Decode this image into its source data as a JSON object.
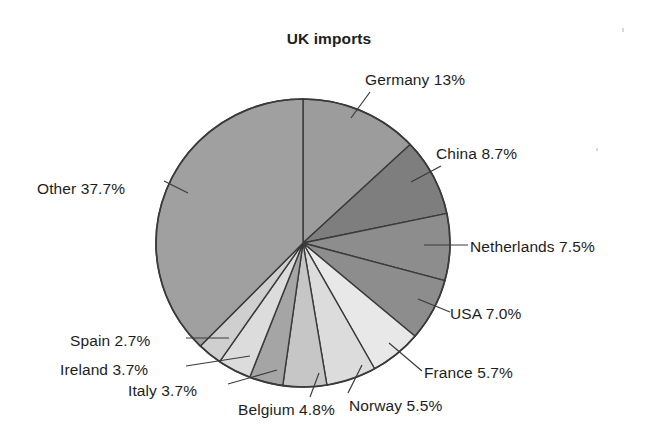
{
  "chart_data": {
    "type": "pie",
    "title": "UK imports",
    "xlabel": "",
    "ylabel": "",
    "legend_position": "none",
    "grid": false,
    "start_angle_deg": 0,
    "direction": "clockwise",
    "categories": [
      "Germany",
      "China",
      "Netherlands",
      "USA",
      "France",
      "Norway",
      "Belgium",
      "Italy",
      "Ireland",
      "Spain",
      "Other"
    ],
    "values": [
      13.0,
      8.7,
      7.5,
      7.0,
      5.7,
      5.5,
      4.8,
      3.7,
      3.7,
      2.7,
      37.7
    ],
    "slices": [
      {
        "label": "Germany 13%",
        "name": "Germany",
        "value": 13.0,
        "color": "#9c9c9c",
        "label_x": 365,
        "label_y": 71,
        "anchor": "start",
        "leader": [
          [
            351,
            118
          ],
          [
            370,
            92
          ]
        ]
      },
      {
        "label": "China 8.7%",
        "name": "China",
        "value": 8.7,
        "color": "#7e7e7e",
        "label_x": 436,
        "label_y": 145,
        "anchor": "start",
        "leader": [
          [
            411,
            182
          ],
          [
            441,
            166
          ]
        ]
      },
      {
        "label": "Netherlands 7.5%",
        "name": "Netherlands",
        "value": 7.5,
        "color": "#8d8d8d",
        "label_x": 470,
        "label_y": 238,
        "anchor": "start",
        "leader": [
          [
            424,
            245
          ],
          [
            468,
            245
          ]
        ]
      },
      {
        "label": "USA 7.0%",
        "name": "USA",
        "value": 7.0,
        "color": "#8d8d8d",
        "label_x": 450,
        "label_y": 305,
        "anchor": "start",
        "leader": [
          [
            418,
            299
          ],
          [
            450,
            312
          ]
        ]
      },
      {
        "label": "France 5.7%",
        "name": "France",
        "value": 5.7,
        "color": "#e8e8e8",
        "label_x": 424,
        "label_y": 364,
        "anchor": "start",
        "leader": [
          [
            389,
            343
          ],
          [
            422,
            371
          ]
        ]
      },
      {
        "label": "Norway 5.5%",
        "name": "Norway",
        "value": 5.5,
        "color": "#dcdcdc",
        "label_x": 349,
        "label_y": 397,
        "anchor": "start",
        "leader": [
          [
            362,
            365
          ],
          [
            348,
            393
          ]
        ]
      },
      {
        "label": "Belgium 4.8%",
        "name": "Belgium",
        "value": 4.8,
        "color": "#c6c6c6",
        "label_x": 238,
        "label_y": 401,
        "anchor": "start",
        "leader": [
          [
            319,
            373
          ],
          [
            310,
            397
          ]
        ]
      },
      {
        "label": "Italy 3.7%",
        "name": "Italy",
        "value": 3.7,
        "color": "#a5a5a5",
        "label_x": 128,
        "label_y": 382,
        "anchor": "start",
        "leader": [
          [
            277,
            370
          ],
          [
            228,
            384
          ]
        ]
      },
      {
        "label": "Ireland 3.7%",
        "name": "Ireland",
        "value": 3.7,
        "color": "#dcdcdc",
        "label_x": 60,
        "label_y": 361,
        "anchor": "start",
        "leader": [
          [
            250,
            356
          ],
          [
            186,
            366
          ]
        ]
      },
      {
        "label": "Spain 2.7%",
        "name": "Spain",
        "value": 2.7,
        "color": "#cfcfcf",
        "label_x": 70,
        "label_y": 332,
        "anchor": "start",
        "leader": [
          [
            229,
            338
          ],
          [
            186,
            338
          ]
        ]
      },
      {
        "label": "Other 37.7%",
        "name": "Other",
        "value": 37.7,
        "color": "#a0a0a0",
        "label_x": 37,
        "label_y": 180,
        "anchor": "start",
        "leader": [
          [
            188,
            193
          ],
          [
            164,
            181
          ]
        ]
      }
    ],
    "geometry": {
      "cx": 303,
      "cy": 243,
      "r": 147,
      "stroke": "#3a3a3a",
      "stroke_width": 1.4
    }
  }
}
